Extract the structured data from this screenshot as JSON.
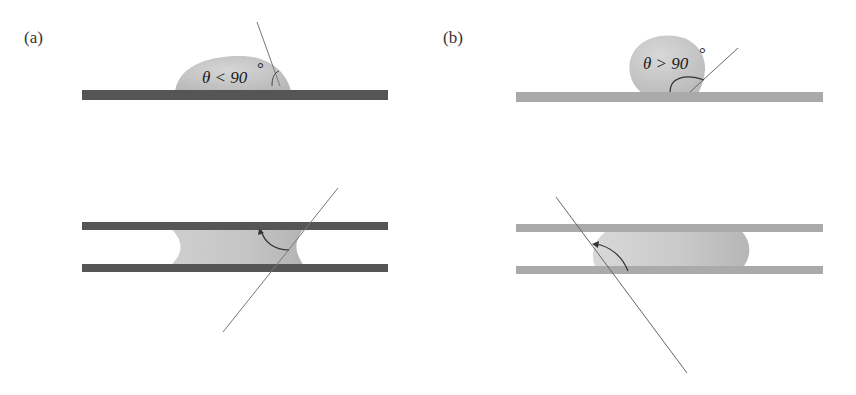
{
  "figure": {
    "panels": [
      {
        "id": "a",
        "label": "(a)",
        "description": "Hydrophilic surface: contact angle less than 90 degrees; concave meniscus between parallel plates",
        "angle_label": "θ < 90",
        "degree_symbol": "°",
        "surface_color": "#555555"
      },
      {
        "id": "b",
        "label": "(b)",
        "description": "Hydrophobic surface: contact angle greater than 90 degrees; convex meniscus between parallel plates",
        "angle_label": "θ > 90",
        "degree_symbol": "°",
        "surface_color": "#aaaaaa"
      }
    ],
    "colors": {
      "droplet": "#c8c8c8",
      "droplet_shade": "#b4b4b4",
      "tangent_line": "#666666",
      "arc": "#333333"
    }
  }
}
